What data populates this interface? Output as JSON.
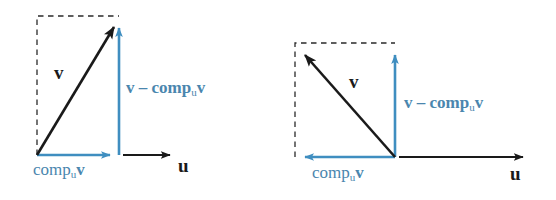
{
  "figure": {
    "type": "vector-projection-diagram",
    "width": 556,
    "height": 200,
    "background": "#ffffff",
    "colors": {
      "vector_black": "#1a1a1a",
      "vector_blue": "#3f8ec0",
      "label_blue": "#4a86ae",
      "label_black": "#1a1a1a",
      "dashed_guide": "#2a2a2a"
    }
  },
  "panels": [
    {
      "id": "left",
      "caption": "acute-angle case",
      "labels": {
        "v": "v",
        "u": "u",
        "comp": "comp",
        "comp_sub": "u",
        "comp_vec": "v",
        "diff_minus": "v – comp",
        "diff_sub": "u",
        "diff_vec": "v"
      },
      "geometry": {
        "origin": [
          37,
          155
        ],
        "v_tip": [
          119,
          18
        ],
        "box_topleft": [
          37,
          16
        ],
        "box_topright": [
          119,
          16
        ],
        "proj_tip": [
          119,
          155
        ],
        "u_axis_start": [
          123,
          155
        ],
        "u_axis_tip": [
          178,
          155
        ],
        "vertical_arrow_base": [
          119,
          155
        ],
        "vertical_arrow_tip": [
          119,
          20
        ]
      },
      "label_positions": {
        "v": [
          57,
          73
        ],
        "u": [
          182,
          155
        ],
        "comp": [
          36,
          172
        ],
        "diff": [
          126,
          88
        ]
      }
    },
    {
      "id": "right",
      "caption": "obtuse-angle case",
      "labels": {
        "v": "v",
        "u": "u",
        "comp": "comp",
        "comp_sub": "u",
        "comp_vec": "v",
        "diff_minus": "v – comp",
        "diff_sub": "u",
        "diff_vec": "v"
      },
      "geometry": {
        "origin": [
          395,
          157
        ],
        "v_tip": [
          297,
          46
        ],
        "box_topleft": [
          295,
          43
        ],
        "box_topright": [
          395,
          43
        ],
        "proj_tip": [
          297,
          157
        ],
        "u_axis_start": [
          399,
          157
        ],
        "u_axis_tip": [
          531,
          157
        ],
        "vertical_arrow_base": [
          395,
          157
        ],
        "vertical_arrow_tip": [
          395,
          47
        ]
      },
      "label_positions": {
        "v": [
          352,
          82
        ],
        "u": [
          513,
          178
        ],
        "comp": [
          318,
          178
        ],
        "diff": [
          405,
          103
        ]
      }
    }
  ]
}
